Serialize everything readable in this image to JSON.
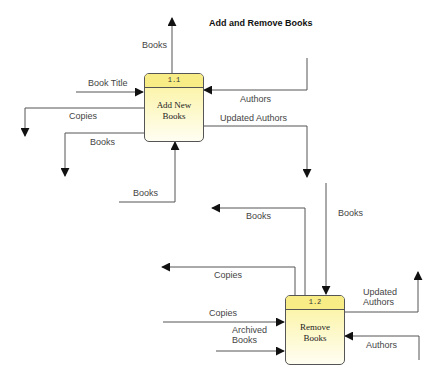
{
  "diagram": {
    "title": "Add and Remove Books",
    "type": "data-flow-diagram",
    "processes": [
      {
        "id": "1.1",
        "name_line1": "Add New",
        "name_line2": "Books"
      },
      {
        "id": "1.2",
        "name_line1": "Remove",
        "name_line2": "Books"
      }
    ],
    "flows": {
      "p1_books_out_up": "Books",
      "p1_book_title_in": "Book Title",
      "p1_authors_in": "Authors",
      "p1_copies_out": "Copies",
      "p1_updated_authors_out": "Updated Authors",
      "p1_books_out_left": "Books",
      "p1_books_in_bottom": "Books",
      "p2_books_out": "Books",
      "p2_books_in": "Books",
      "p2_copies_out": "Copies",
      "p2_copies_in": "Copies",
      "p2_archived_books_in_line1": "Archived",
      "p2_archived_books_in_line2": "Books",
      "p2_updated_authors_out_line1": "Updated",
      "p2_updated_authors_out_line2": "Authors",
      "p2_authors_in": "Authors"
    },
    "colors": {
      "line": "#555555",
      "arrow": "#111111",
      "process_fill_top": "#f8ec86",
      "process_fill_bottom": "#fffef2",
      "label": "#444444"
    }
  }
}
